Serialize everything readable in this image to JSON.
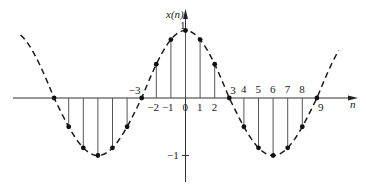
{
  "chart_data": {
    "type": "stem",
    "title": "",
    "function": "x(n) = cos(pi*n/6)",
    "xlabel": "n",
    "ylabel": "x(n)",
    "ylim": [
      -1,
      1
    ],
    "xlim": [
      -11.3,
      10.5
    ],
    "grid": false,
    "legend": null,
    "envelope": {
      "style": "dashed",
      "description": "continuous cosine envelope through sample points"
    },
    "x": [
      -9,
      -8,
      -7,
      -6,
      -5,
      -4,
      -3,
      -2,
      -1,
      0,
      1,
      2,
      3,
      4,
      5,
      6,
      7,
      8,
      9
    ],
    "values": [
      0,
      -0.5,
      -0.866,
      -1,
      -0.866,
      -0.5,
      0,
      0.5,
      0.866,
      1,
      0.866,
      0.5,
      0,
      -0.5,
      -0.866,
      -1,
      -0.866,
      -0.5,
      0
    ],
    "x_tick_labels": [
      {
        "n": -3,
        "text": "−3",
        "pos": "above-left"
      },
      {
        "n": -2,
        "text": "−2",
        "pos": "below"
      },
      {
        "n": -1,
        "text": "−1",
        "pos": "below"
      },
      {
        "n": 0,
        "text": "0",
        "pos": "below"
      },
      {
        "n": 1,
        "text": "1",
        "pos": "below"
      },
      {
        "n": 2,
        "text": "2",
        "pos": "below"
      },
      {
        "n": 3,
        "text": "3",
        "pos": "above-right"
      },
      {
        "n": 4,
        "text": "4",
        "pos": "above"
      },
      {
        "n": 5,
        "text": "5",
        "pos": "above"
      },
      {
        "n": 6,
        "text": "6",
        "pos": "above"
      },
      {
        "n": 7,
        "text": "7",
        "pos": "above"
      },
      {
        "n": 8,
        "text": "8",
        "pos": "above"
      },
      {
        "n": 9,
        "text": "9",
        "pos": "below-right"
      }
    ],
    "y_tick_labels": [
      {
        "y": 1,
        "text": "1"
      },
      {
        "y": -1,
        "text": "−1"
      }
    ]
  },
  "labels": {
    "y_axis": "x(n)",
    "x_axis": "n",
    "y_max": "1",
    "y_min": "−1"
  },
  "colors": {
    "line": "#1a1a1a",
    "stem": "#555555",
    "axis": "#333333"
  }
}
